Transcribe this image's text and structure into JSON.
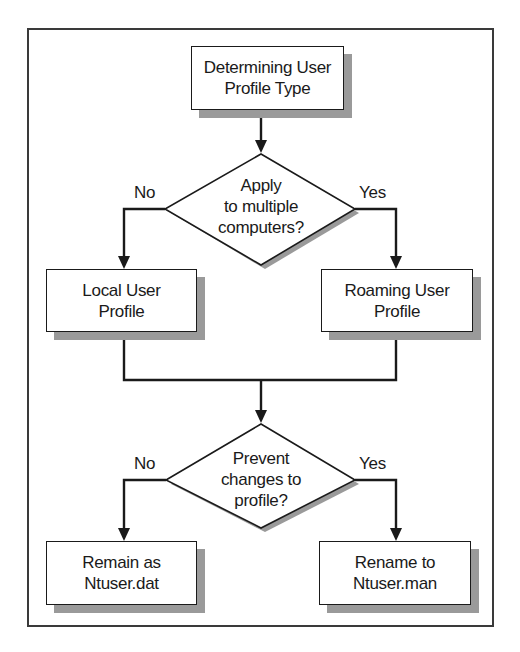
{
  "diagram": {
    "title": "Determining User Profile Type",
    "nodes": {
      "start": {
        "label": "Determining User\nProfile Type",
        "shape": "rectangle"
      },
      "decision1": {
        "label": "Apply\nto multiple\ncomputers?",
        "shape": "diamond"
      },
      "local": {
        "label": "Local User\nProfile",
        "shape": "rectangle"
      },
      "roaming": {
        "label": "Roaming User\nProfile",
        "shape": "rectangle"
      },
      "decision2": {
        "label": "Prevent\nchanges to\nprofile?",
        "shape": "diamond"
      },
      "remain": {
        "label": "Remain as\nNtuser.dat",
        "shape": "rectangle"
      },
      "rename": {
        "label": "Rename to\nNtuser.man",
        "shape": "rectangle"
      }
    },
    "edges": {
      "d1_no": {
        "from": "decision1",
        "to": "local",
        "label": "No"
      },
      "d1_yes": {
        "from": "decision1",
        "to": "roaming",
        "label": "Yes"
      },
      "d2_no": {
        "from": "decision2",
        "to": "remain",
        "label": "No"
      },
      "d2_yes": {
        "from": "decision2",
        "to": "rename",
        "label": "Yes"
      }
    },
    "colors": {
      "line": "#1a1a1a",
      "shadow": "#9a9a9a",
      "frame": "#3a3a3a",
      "background": "#ffffff"
    }
  }
}
